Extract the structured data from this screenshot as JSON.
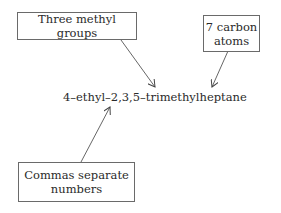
{
  "diagram": {
    "compound_name": "4–ethyl–2,3,5–trimethylheptane",
    "labels": [
      {
        "id": "methyl",
        "text": "Three methyl groups"
      },
      {
        "id": "carbon",
        "text": "7 carbon atoms"
      },
      {
        "id": "commas",
        "text": "Commas separate numbers"
      }
    ],
    "line_color": "#555555"
  }
}
